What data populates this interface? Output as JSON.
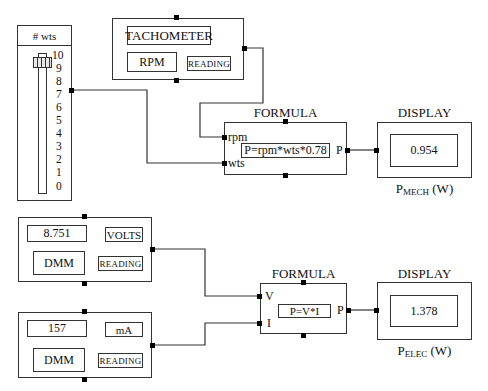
{
  "slider": {
    "title": "# wts",
    "ticks": [
      "10",
      "9",
      "8",
      "7",
      "6",
      "5",
      "4",
      "3",
      "2",
      "1",
      "0"
    ],
    "value": 9.5,
    "min": 0,
    "max": 10
  },
  "tachometer": {
    "title": "TACHOMETER",
    "unit": "RPM",
    "mode": "READING"
  },
  "formula_mech": {
    "label": "FORMULA",
    "inputs": [
      "rpm",
      "wts"
    ],
    "expression": "P=rpm*wts*0.78",
    "output": "P"
  },
  "display_mech": {
    "label": "DISPLAY",
    "value": "0.954",
    "caption_main": "P",
    "caption_sub": "MECH",
    "caption_unit": "(W)"
  },
  "dmm_volts": {
    "value": "8.751",
    "unit": "VOLTS",
    "name": "DMM",
    "mode": "READING"
  },
  "dmm_current": {
    "value": "157",
    "unit": "mA",
    "name": "DMM",
    "mode": "READING"
  },
  "formula_elec": {
    "label": "FORMULA",
    "inputs": [
      "V",
      "I"
    ],
    "expression": "P=V*I",
    "output": "P"
  },
  "display_elec": {
    "label": "DISPLAY",
    "value": "1.378",
    "caption_main": "P",
    "caption_sub": "ELEC",
    "caption_unit": "(W)"
  }
}
